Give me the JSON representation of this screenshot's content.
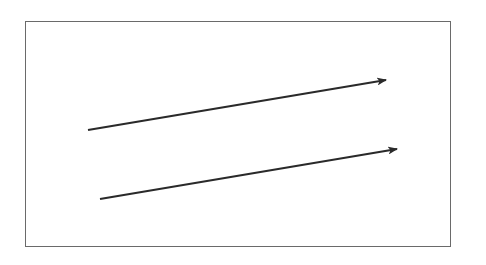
{
  "diagram": {
    "frame": {
      "x": 25,
      "y": 21,
      "width": 426,
      "height": 226,
      "stroke": "#6a6a6a"
    },
    "arrows": [
      {
        "name": "upper-arrow",
        "x1": 88,
        "y1": 130,
        "x2": 386,
        "y2": 80,
        "color": "#2a2a2a"
      },
      {
        "name": "lower-arrow",
        "x1": 100,
        "y1": 199,
        "x2": 397,
        "y2": 149,
        "color": "#2a2a2a"
      }
    ]
  }
}
